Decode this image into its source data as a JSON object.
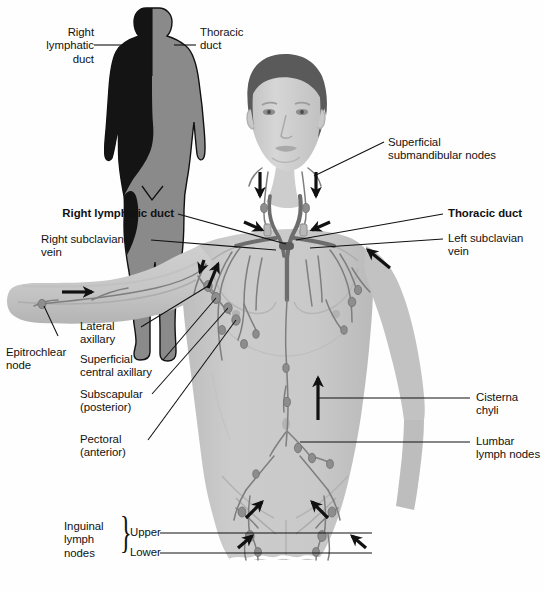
{
  "figure": {
    "background_color": "#fefefe",
    "ink_color": "#111111",
    "body_fill": "#c9c9c9",
    "body_shade": "#b3b3b3",
    "vessel_color": "#7e7e7e",
    "duct_color": "#6d6d6d",
    "silhouette_gray": "#8a8a8a",
    "silhouette_black": "#141414",
    "hair_color": "#5a5a5a",
    "skin_color": "#d2d2d2"
  },
  "inset": {
    "name": "drainage-silhouette",
    "labels": {
      "right_lymphatic_duct": "Right\nlymphatic\nduct",
      "thoracic_duct": "Thoracic\nduct"
    }
  },
  "labels": {
    "right_lymphatic_duct": "Right lymphatic duct",
    "right_subclavian_vein": "Right subclavian\nvein",
    "epitrochlear_node": "Epitrochlear\nnode",
    "lateral_axillary": "Lateral\naxillary",
    "superficial_central_axillary": "Superficial\ncentral axillary",
    "subscapular_posterior": "Subscapular\n(posterior)",
    "pectoral_anterior": "Pectoral\n(anterior)",
    "superficial_submandibular_nodes": "Superficial\nsubmandibular nodes",
    "thoracic_duct": "Thoracic duct",
    "left_subclavian_vein": "Left subclavian\nvein",
    "cisterna_chyli": "Cisterna\nchyli",
    "lumbar_lymph_nodes": "Lumbar\nlymph nodes",
    "inguinal_lymph_nodes": "Inguinal\nlymph\nnodes",
    "inguinal_upper": "Upper",
    "inguinal_lower": "Lower"
  }
}
